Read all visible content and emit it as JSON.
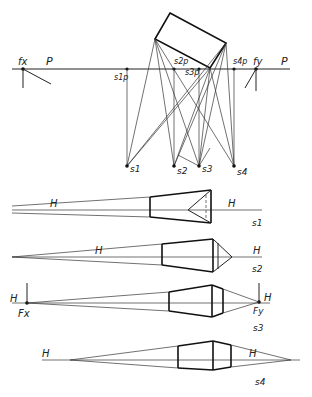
{
  "plan": {
    "picture_plane_label": "P",
    "picture_plane_label_right": "P",
    "fx_label": "fx",
    "fy_label": "fy",
    "stations": [
      {
        "label": "s1",
        "pierce_label": "s1p"
      },
      {
        "label": "s2",
        "pierce_label": "s2p"
      },
      {
        "label": "s3",
        "pierce_label": "s3p"
      },
      {
        "label": "s4",
        "pierce_label": "s4p"
      }
    ]
  },
  "views": [
    {
      "id": "s1",
      "caption": "s1",
      "horizon_labels": [
        "H",
        "H"
      ]
    },
    {
      "id": "s2",
      "caption": "s2",
      "horizon_labels": [
        "H",
        "H"
      ]
    },
    {
      "id": "s3",
      "caption": "s3",
      "horizon_labels": [
        "H",
        "H"
      ],
      "vp_left": "Fx",
      "vp_right": "Fy"
    },
    {
      "id": "s4",
      "caption": "s4",
      "horizon_labels": [
        "H",
        "H"
      ]
    }
  ]
}
